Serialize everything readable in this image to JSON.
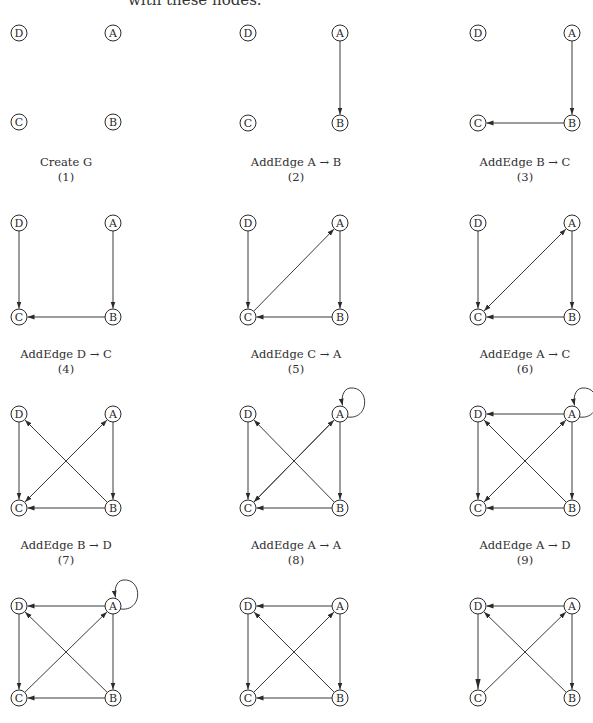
{
  "intro_text": "with these nodes.",
  "style": {
    "stroke_color": "#3a3a3a",
    "node_fill": "#ffffff",
    "background": "#ffffff"
  },
  "nodes": [
    "A",
    "B",
    "C",
    "D"
  ],
  "panels": [
    {
      "id": 1,
      "caption": "Create G",
      "number": "(1)",
      "origin": [
        19,
        33
      ],
      "spacing": [
        94,
        89
      ],
      "edges": [],
      "self_loop_A": false
    },
    {
      "id": 2,
      "caption": "AddEdge A → B",
      "number": "(2)",
      "origin": [
        248,
        33
      ],
      "spacing": [
        92,
        90
      ],
      "edges": [
        [
          "A",
          "B"
        ]
      ],
      "self_loop_A": false
    },
    {
      "id": 3,
      "caption": "AddEdge B → C",
      "number": "(3)",
      "origin": [
        478,
        33
      ],
      "spacing": [
        94,
        90
      ],
      "edges": [
        [
          "A",
          "B"
        ],
        [
          "B",
          "C"
        ]
      ],
      "self_loop_A": false
    },
    {
      "id": 4,
      "caption": "AddEdge D → C",
      "number": "(4)",
      "origin": [
        19,
        223
      ],
      "spacing": [
        94,
        94
      ],
      "edges": [
        [
          "A",
          "B"
        ],
        [
          "B",
          "C"
        ],
        [
          "D",
          "C"
        ]
      ],
      "self_loop_A": false
    },
    {
      "id": 5,
      "caption": "AddEdge C → A",
      "number": "(5)",
      "origin": [
        248,
        223
      ],
      "spacing": [
        92,
        94
      ],
      "edges": [
        [
          "A",
          "B"
        ],
        [
          "B",
          "C"
        ],
        [
          "D",
          "C"
        ],
        [
          "C",
          "A"
        ]
      ],
      "self_loop_A": false
    },
    {
      "id": 6,
      "caption": "AddEdge A → C",
      "number": "(6)",
      "origin": [
        478,
        223
      ],
      "spacing": [
        94,
        94
      ],
      "edges": [
        [
          "A",
          "B"
        ],
        [
          "B",
          "C"
        ],
        [
          "D",
          "C"
        ],
        [
          "C",
          "A"
        ],
        [
          "A",
          "C"
        ]
      ],
      "self_loop_A": false
    },
    {
      "id": 7,
      "caption": "AddEdge B → D",
      "number": "(7)",
      "origin": [
        19,
        414
      ],
      "spacing": [
        94,
        94
      ],
      "edges": [
        [
          "A",
          "B"
        ],
        [
          "B",
          "C"
        ],
        [
          "D",
          "C"
        ],
        [
          "C",
          "A"
        ],
        [
          "A",
          "C"
        ],
        [
          "B",
          "D"
        ]
      ],
      "self_loop_A": false
    },
    {
      "id": 8,
      "caption": "AddEdge A → A",
      "number": "(8)",
      "origin": [
        248,
        414
      ],
      "spacing": [
        92,
        94
      ],
      "edges": [
        [
          "A",
          "B"
        ],
        [
          "B",
          "C"
        ],
        [
          "D",
          "C"
        ],
        [
          "C",
          "A"
        ],
        [
          "A",
          "C"
        ],
        [
          "B",
          "D"
        ]
      ],
      "self_loop_A": true
    },
    {
      "id": 9,
      "caption": "AddEdge A → D",
      "number": "(9)",
      "origin": [
        478,
        414
      ],
      "spacing": [
        94,
        94
      ],
      "edges": [
        [
          "A",
          "B"
        ],
        [
          "B",
          "C"
        ],
        [
          "D",
          "C"
        ],
        [
          "C",
          "A"
        ],
        [
          "A",
          "C"
        ],
        [
          "B",
          "D"
        ],
        [
          "A",
          "D"
        ]
      ],
      "self_loop_A": true
    },
    {
      "id": 10,
      "caption": "",
      "number": "",
      "origin": [
        19,
        606
      ],
      "spacing": [
        94,
        92
      ],
      "edges": [
        [
          "A",
          "B"
        ],
        [
          "B",
          "C"
        ],
        [
          "D",
          "C"
        ],
        [
          "C",
          "A"
        ],
        [
          "B",
          "D"
        ],
        [
          "A",
          "D"
        ]
      ],
      "self_loop_A": true
    },
    {
      "id": 11,
      "caption": "",
      "number": "",
      "origin": [
        248,
        606
      ],
      "spacing": [
        92,
        92
      ],
      "edges": [
        [
          "A",
          "B"
        ],
        [
          "B",
          "C"
        ],
        [
          "D",
          "C"
        ],
        [
          "C",
          "A"
        ],
        [
          "B",
          "D"
        ],
        [
          "A",
          "D"
        ]
      ],
      "self_loop_A": false
    },
    {
      "id": 12,
      "caption": "",
      "number": "",
      "origin": [
        478,
        606
      ],
      "spacing": [
        94,
        92
      ],
      "edges": [
        [
          "A",
          "B"
        ],
        [
          "D",
          "C"
        ],
        [
          "C",
          "A"
        ],
        [
          "B",
          "D"
        ],
        [
          "A",
          "D"
        ]
      ],
      "self_loop_A": false,
      "large_arrow_edges": [
        [
          "D",
          "C"
        ]
      ]
    }
  ],
  "captions": {
    "p1": {
      "title": "Create G",
      "num": "(1)"
    },
    "p2": {
      "title": "AddEdge A → B",
      "num": "(2)"
    },
    "p3": {
      "title": "AddEdge B → C",
      "num": "(3)"
    },
    "p4": {
      "title": "AddEdge D → C",
      "num": "(4)"
    },
    "p5": {
      "title": "AddEdge C → A",
      "num": "(5)"
    },
    "p6": {
      "title": "AddEdge A → C",
      "num": "(6)"
    },
    "p7": {
      "title": "AddEdge B → D",
      "num": "(7)"
    },
    "p8": {
      "title": "AddEdge A → A",
      "num": "(8)"
    },
    "p9": {
      "title": "AddEdge A → D",
      "num": "(9)"
    }
  }
}
